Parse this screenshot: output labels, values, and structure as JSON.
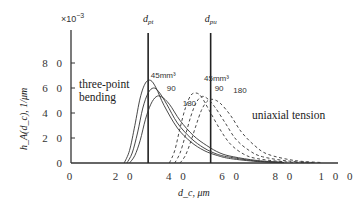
{
  "chart_data": {
    "type": "line",
    "title": "",
    "xlabel": "d_c, μm",
    "ylabel": "h_A(d_c), 1/μm",
    "y_scale_label": "×10^-3",
    "xlim": [
      0,
      100
    ],
    "ylim": [
      0,
      100
    ],
    "x_ticks": [
      0,
      20,
      40,
      60,
      80,
      100
    ],
    "x_tick_labels": [
      "0",
      "2 0",
      "4 0",
      "6 0",
      "8 0",
      "1 0 0"
    ],
    "y_ticks": [
      0,
      20,
      40,
      60,
      80
    ],
    "y_tick_labels": [
      "0",
      "2 0",
      "4 0",
      "6 0",
      "8 0"
    ],
    "grid": false,
    "legend": "none (inline annotations)",
    "vertical_lines": [
      {
        "label": "d_pt",
        "x": 29
      },
      {
        "label": "d_pu",
        "x": 52.5
      }
    ],
    "annotations": [
      {
        "text": "three-point bending",
        "x": 8,
        "y": 60
      },
      {
        "text": "uniaxial tension",
        "x": 74,
        "y": 40
      },
      {
        "text": "45mm³",
        "group": "bending",
        "x": 30,
        "y": 68
      },
      {
        "text": "90",
        "group": "bending",
        "x": 36,
        "y": 58
      },
      {
        "text": "180",
        "group": "bending",
        "x": 42,
        "y": 46
      },
      {
        "text": "45mm³",
        "group": "tension",
        "x": 50,
        "y": 66
      },
      {
        "text": "90",
        "group": "tension",
        "x": 54,
        "y": 58
      },
      {
        "text": "180",
        "group": "tension",
        "x": 61,
        "y": 56
      }
    ],
    "series": [
      {
        "name": "three-point bending 45 mm³",
        "style": "solid",
        "x": [
          20,
          22,
          24,
          26,
          28,
          30,
          32,
          35,
          40,
          45,
          50,
          55,
          60,
          70,
          80
        ],
        "y": [
          0,
          10,
          30,
          52,
          64,
          66,
          60,
          46,
          28,
          17,
          10,
          6,
          3.5,
          1.2,
          0.3
        ]
      },
      {
        "name": "three-point bending 90 mm³",
        "style": "solid",
        "x": [
          21,
          23,
          25,
          27,
          29,
          31,
          33,
          36,
          40,
          45,
          50,
          55,
          60,
          70,
          80
        ],
        "y": [
          0,
          8,
          24,
          44,
          56,
          60,
          57,
          47,
          32,
          20,
          12,
          7,
          4.5,
          1.5,
          0.4
        ]
      },
      {
        "name": "three-point bending 180 mm³",
        "style": "solid",
        "x": [
          22,
          24,
          26,
          28,
          30,
          32,
          34,
          37,
          41,
          46,
          51,
          56,
          61,
          70,
          80
        ],
        "y": [
          0,
          6,
          18,
          35,
          47,
          53,
          53,
          47,
          34,
          22,
          14,
          8,
          5,
          2,
          0.5
        ]
      },
      {
        "name": "uniaxial tension 45 mm³",
        "style": "dashed",
        "x": [
          37,
          39,
          41,
          43,
          45,
          47,
          49,
          52,
          56,
          60,
          65,
          70,
          80,
          90
        ],
        "y": [
          0,
          10,
          28,
          44,
          54,
          56,
          53,
          42,
          27,
          15,
          7,
          3.5,
          1,
          0.2
        ]
      },
      {
        "name": "uniaxial tension 90 mm³",
        "style": "dashed",
        "x": [
          39,
          41,
          43,
          45,
          47,
          49,
          51,
          54,
          58,
          62,
          67,
          72,
          82,
          92
        ],
        "y": [
          0,
          8,
          22,
          37,
          48,
          53,
          52,
          45,
          32,
          19,
          10,
          5,
          1.5,
          0.3
        ]
      },
      {
        "name": "uniaxial tension 180 mm³",
        "style": "dashed",
        "x": [
          41,
          43,
          45,
          47,
          49,
          51,
          53,
          56,
          60,
          64,
          69,
          74,
          84,
          94
        ],
        "y": [
          0,
          6,
          17,
          30,
          42,
          49,
          51,
          48,
          38,
          25,
          14,
          7,
          2,
          0.4
        ]
      }
    ]
  }
}
